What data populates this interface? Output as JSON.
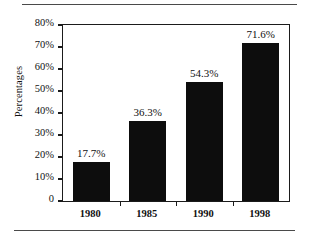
{
  "chart_data": {
    "type": "bar",
    "title": "",
    "subtitle": "",
    "xlabel": "",
    "ylabel": "Percentages",
    "categories": [
      "1980",
      "1985",
      "1990",
      "1998"
    ],
    "values": [
      17.7,
      36.3,
      54.3,
      71.6
    ],
    "value_labels": [
      "17.7%",
      "36.3%",
      "54.3%",
      "71.6%"
    ],
    "ylim": [
      0,
      80
    ],
    "ytick_values": [
      0,
      10,
      20,
      30,
      40,
      50,
      60,
      70,
      80
    ],
    "ytick_labels": [
      "0",
      "10%",
      "20%",
      "30%",
      "40%",
      "50%",
      "60%",
      "70%",
      "80%"
    ],
    "grid": false,
    "legend": false,
    "legend_position": "none",
    "bar_color": "#0d0d0d",
    "axis_color": "#1b1b1b",
    "background_color": "#ffffff"
  },
  "decorations": {
    "top_rule": "",
    "bottom_rule": ""
  }
}
